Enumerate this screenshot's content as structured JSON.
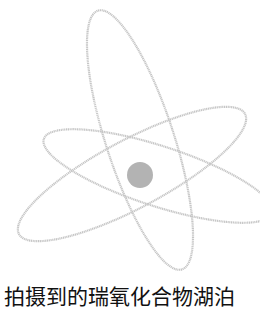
{
  "figure": {
    "orbit_color": "#c4c4c4",
    "nucleus_color": "#b0b0b0",
    "background": "#ffffff"
  },
  "caption": {
    "text": "拍摄到的瑞氧化合物湖泊"
  }
}
